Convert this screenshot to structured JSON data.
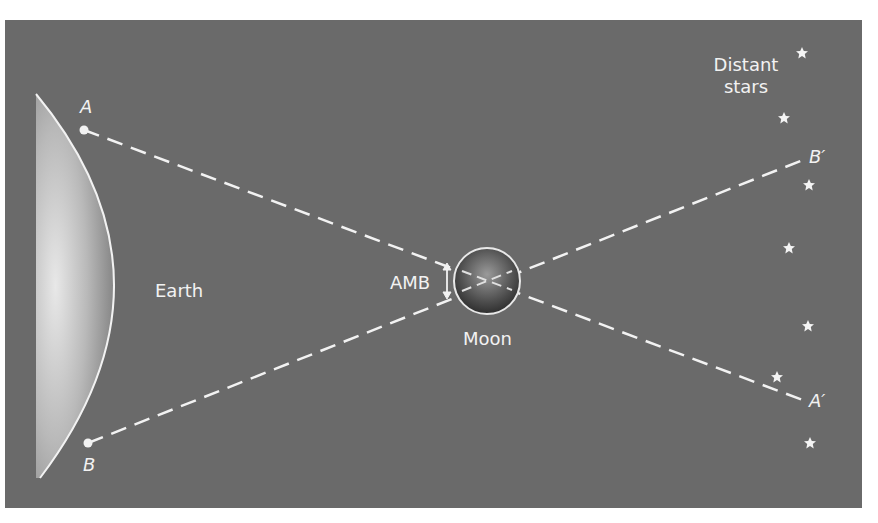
{
  "diagram": {
    "bodies": {
      "earth": {
        "label": "Earth"
      },
      "moon": {
        "label": "Moon"
      }
    },
    "points": {
      "a": "A",
      "b": "B",
      "a_prime": "A′",
      "b_prime": "B′"
    },
    "angle_label": "AMB",
    "stars_label_line1": "Distant",
    "stars_label_line2": "stars",
    "colors": {
      "background": "#6a6a6a",
      "foreground": "#f2f2f2"
    }
  }
}
